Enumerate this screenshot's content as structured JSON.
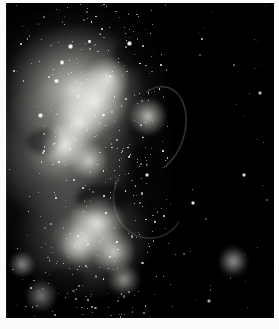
{
  "image": {
    "kind": "astronomical-photograph",
    "subject": "irregular starburst galaxy with giant HII complex",
    "palette": "grayscale",
    "caption": "",
    "background_color": "#000000",
    "mount_color": "#fbfbfb",
    "highlight_color": "#ffffff",
    "nebula_tone": "#d7d5d0",
    "width": 279,
    "height": 329,
    "frame": {
      "left": 6,
      "top": 3,
      "width": 268,
      "height": 315
    }
  },
  "chart_data": {
    "type": "heatmap",
    "title": "",
    "xlabel": "",
    "ylabel": "",
    "knots": [
      {
        "name": "core-knot-a",
        "x": 33,
        "y": 31,
        "rx": 13,
        "ry": 10,
        "brightness": 96
      },
      {
        "name": "core-knot-b",
        "x": 27,
        "y": 38,
        "rx": 10,
        "ry": 8,
        "brightness": 88
      },
      {
        "name": "core-knot-c",
        "x": 38,
        "y": 24,
        "rx": 8,
        "ry": 7,
        "brightness": 82
      },
      {
        "name": "mid-knot-a",
        "x": 22,
        "y": 45,
        "rx": 9,
        "ry": 7,
        "brightness": 85
      },
      {
        "name": "mid-knot-b",
        "x": 31,
        "y": 50,
        "rx": 7,
        "ry": 6,
        "brightness": 74
      },
      {
        "name": "east-knot",
        "x": 53,
        "y": 36,
        "rx": 7,
        "ry": 6,
        "brightness": 78
      },
      {
        "name": "south-clump-a",
        "x": 34,
        "y": 70,
        "rx": 10,
        "ry": 9,
        "brightness": 90
      },
      {
        "name": "south-clump-b",
        "x": 40,
        "y": 79,
        "rx": 8,
        "ry": 7,
        "brightness": 80
      },
      {
        "name": "south-clump-c",
        "x": 27,
        "y": 77,
        "rx": 7,
        "ry": 6,
        "brightness": 72
      },
      {
        "name": "south-tail",
        "x": 44,
        "y": 88,
        "rx": 6,
        "ry": 5,
        "brightness": 66
      },
      {
        "name": "companion-blob",
        "x": 85,
        "y": 82,
        "rx": 5,
        "ry": 5,
        "brightness": 83
      },
      {
        "name": "lower-left-blob-a",
        "x": 6,
        "y": 83,
        "rx": 5,
        "ry": 4,
        "brightness": 70
      },
      {
        "name": "lower-left-blob-b",
        "x": 13,
        "y": 93,
        "rx": 6,
        "ry": 5,
        "brightness": 64
      }
    ],
    "bright_stars": [
      {
        "x": 23,
        "y": 13,
        "mag": 100
      },
      {
        "x": 45,
        "y": 12,
        "mag": 98
      },
      {
        "x": 20,
        "y": 18,
        "mag": 86
      },
      {
        "x": 18,
        "y": 24,
        "mag": 80
      },
      {
        "x": 12,
        "y": 35,
        "mag": 74
      },
      {
        "x": 52,
        "y": 54,
        "mag": 62
      },
      {
        "x": 88,
        "y": 54,
        "mag": 70
      },
      {
        "x": 94,
        "y": 28,
        "mag": 58
      },
      {
        "x": 69,
        "y": 63,
        "mag": 55
      },
      {
        "x": 75,
        "y": 94,
        "mag": 52
      }
    ],
    "field": {
      "nebula_extent_x": [
        0,
        58
      ],
      "nebula_extent_y": [
        2,
        98
      ],
      "dark_sky_fraction": 0.45,
      "star_count_estimate": 420
    }
  }
}
